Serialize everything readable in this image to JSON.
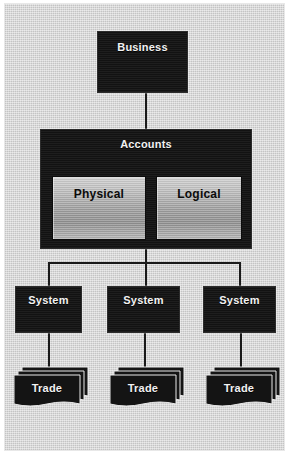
{
  "diagram": {
    "type": "block-hierarchy",
    "background_color": "#d2d2d2",
    "node_fill_color": "#141414",
    "node_text_color": "#f2f2f2",
    "subnode_gradient_from": "#cfcfcf",
    "subnode_gradient_to": "#8f8f8f",
    "connector_color": "#1a1a1a"
  },
  "nodes": {
    "business": {
      "label": "Business"
    },
    "accounts": {
      "label": "Accounts",
      "children": [
        {
          "label": "Physical"
        },
        {
          "label": "Logical"
        }
      ]
    },
    "systems": [
      {
        "label": "System"
      },
      {
        "label": "System"
      },
      {
        "label": "System"
      }
    ],
    "trades": [
      {
        "label": "Trade"
      },
      {
        "label": "Trade"
      },
      {
        "label": "Trade"
      }
    ]
  }
}
